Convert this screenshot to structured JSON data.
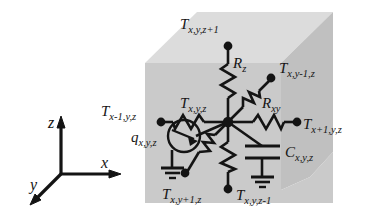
{
  "figure": {
    "background_color": "#ffffff",
    "ink_color": "#141414",
    "cube": {
      "front_face_color": "#c8c8c8",
      "top_face_color": "#dedede",
      "right_face_color": "#bdbdbd"
    },
    "axes": {
      "x_label": "x",
      "y_label": "y",
      "z_label": "z"
    },
    "nodes": [
      {
        "id": "center",
        "label": "T",
        "sub": "x,y,z"
      },
      {
        "id": "zplus",
        "label": "T",
        "sub": "x,y,z+1"
      },
      {
        "id": "zminus",
        "label": "T",
        "sub": "x,y,z-1"
      },
      {
        "id": "xminus",
        "label": "T",
        "sub": "x-1,y,z"
      },
      {
        "id": "xplus",
        "label": "T",
        "sub": "x+1,y,z"
      },
      {
        "id": "yminus",
        "label": "T",
        "sub": "x,y-1,z"
      },
      {
        "id": "yplus",
        "label": "T",
        "sub": "x,y+1,z"
      }
    ],
    "components": [
      {
        "id": "rz",
        "type": "resistor",
        "label": "R",
        "sub": "z"
      },
      {
        "id": "rxy",
        "type": "resistor",
        "label": "R",
        "sub": "xy"
      },
      {
        "id": "cap",
        "type": "capacitor",
        "label": "C",
        "sub": "x,y,z"
      },
      {
        "id": "q",
        "type": "current-source",
        "label": "q",
        "sub": "x,y,z"
      }
    ],
    "labels": {
      "t_center": {
        "base": "T",
        "sub": "x,y,z"
      },
      "t_zplus": {
        "base": "T",
        "sub": "x,y,z+1"
      },
      "t_zminus": {
        "base": "T",
        "sub": "x,y,z-1"
      },
      "t_xminus": {
        "base": "T",
        "sub": "x-1,y,z"
      },
      "t_xplus": {
        "base": "T",
        "sub": "x+1,y,z"
      },
      "t_yminus": {
        "base": "T",
        "sub": "x,y-1,z"
      },
      "t_yplus": {
        "base": "T",
        "sub": "x,y+1,z"
      },
      "r_z": {
        "base": "R",
        "sub": "z"
      },
      "r_xy": {
        "base": "R",
        "sub": "xy"
      },
      "c_xyz": {
        "base": "C",
        "sub": "x,y,z"
      },
      "q_xyz": {
        "base": "q",
        "sub": "x,y,z"
      },
      "axis_x": {
        "base": "x",
        "sub": ""
      },
      "axis_y": {
        "base": "y",
        "sub": ""
      },
      "axis_z": {
        "base": "z",
        "sub": ""
      }
    }
  }
}
